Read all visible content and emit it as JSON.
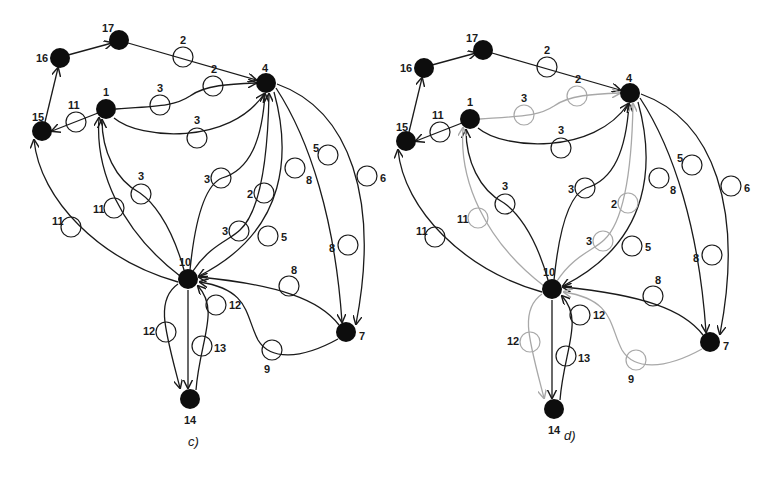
{
  "panels": [
    {
      "id": "c",
      "caption": "c)",
      "nodes": [
        {
          "id": "1",
          "label": "1"
        },
        {
          "id": "4",
          "label": "4"
        },
        {
          "id": "7",
          "label": "7"
        },
        {
          "id": "10",
          "label": "10"
        },
        {
          "id": "14",
          "label": "14"
        },
        {
          "id": "15",
          "label": "15"
        },
        {
          "id": "16",
          "label": "16"
        },
        {
          "id": "17",
          "label": "17"
        }
      ],
      "edges": [
        {
          "from": "16",
          "to": "17",
          "weight": ""
        },
        {
          "from": "15",
          "to": "16",
          "weight": ""
        },
        {
          "from": "17",
          "to": "4",
          "weight": "2"
        },
        {
          "from": "17",
          "to": "4",
          "weight": "2",
          "note": "second marker on same path"
        },
        {
          "from": "1",
          "to": "4",
          "weight": "3",
          "route": "upper"
        },
        {
          "from": "1",
          "to": "4",
          "weight": "3",
          "route": "lower"
        },
        {
          "from": "1",
          "to": "15",
          "weight": "11"
        },
        {
          "from": "10",
          "to": "15",
          "weight": "11"
        },
        {
          "from": "10",
          "to": "1",
          "weight": "11"
        },
        {
          "from": "10",
          "to": "1",
          "weight": "3"
        },
        {
          "from": "10",
          "to": "4",
          "weight": "3"
        },
        {
          "from": "10",
          "to": "4",
          "weight": "2"
        },
        {
          "from": "10",
          "to": "4",
          "weight": "3",
          "route": "inner"
        },
        {
          "from": "4",
          "to": "10",
          "weight": "8"
        },
        {
          "from": "4",
          "to": "10",
          "weight": "5"
        },
        {
          "from": "4",
          "to": "7",
          "weight": "5"
        },
        {
          "from": "4",
          "to": "7",
          "weight": "8"
        },
        {
          "from": "4",
          "to": "7",
          "weight": "6"
        },
        {
          "from": "7",
          "to": "10",
          "weight": "8"
        },
        {
          "from": "7",
          "to": "10",
          "weight": "9"
        },
        {
          "from": "10",
          "to": "14",
          "weight": "12",
          "route": "left"
        },
        {
          "from": "10",
          "to": "14",
          "weight": ""
        },
        {
          "from": "10",
          "to": "14",
          "weight": "13"
        },
        {
          "from": "14",
          "to": "10",
          "weight": "12",
          "route": "right"
        }
      ]
    },
    {
      "id": "d",
      "caption": "d)",
      "nodes": [
        {
          "id": "1",
          "label": "1"
        },
        {
          "id": "4",
          "label": "4"
        },
        {
          "id": "7",
          "label": "7"
        },
        {
          "id": "10",
          "label": "10"
        },
        {
          "id": "14",
          "label": "14"
        },
        {
          "id": "15",
          "label": "15"
        },
        {
          "id": "16",
          "label": "16"
        },
        {
          "id": "17",
          "label": "17"
        }
      ],
      "highlighted_note": "gray edges indicate removed/inactive links",
      "gray_edges": [
        {
          "from": "1",
          "to": "4",
          "weight": "3"
        },
        {
          "from": "1",
          "to": "4",
          "weight": "2"
        },
        {
          "from": "10",
          "to": "1",
          "weight": "11"
        },
        {
          "from": "10",
          "to": "4",
          "weight": "2"
        },
        {
          "from": "10",
          "to": "4",
          "weight": "3"
        },
        {
          "from": "10",
          "to": "14",
          "weight": "12"
        },
        {
          "from": "7",
          "to": "10",
          "weight": "9"
        }
      ]
    }
  ],
  "labels": {
    "c": {
      "n1": "1",
      "n4": "4",
      "n7": "7",
      "n10": "10",
      "n14": "14",
      "n15": "15",
      "n16": "16",
      "n17": "17",
      "w_17_4_a": "2",
      "w_17_4_b": "2",
      "w_1_4_up": "3",
      "w_1_4_low": "3",
      "w_1_15": "11",
      "w_10_15": "11",
      "w_10_1a": "11",
      "w_10_1b": "3",
      "w_10_4a": "3",
      "w_10_4b": "2",
      "w_10_4c": "3",
      "w_4_10a": "8",
      "w_4_10b": "5",
      "w_4_7a": "5",
      "w_4_7b": "8",
      "w_4_7c": "6",
      "w_7_10a": "8",
      "w_7_10b": "9",
      "w_10_14a": "12",
      "w_10_14b": "13",
      "w_10_14c": "12",
      "caption": "c)"
    },
    "d": {
      "n1": "1",
      "n4": "4",
      "n7": "7",
      "n10": "10",
      "n14": "14",
      "n15": "15",
      "n16": "16",
      "n17": "17",
      "w_17_4_a": "2",
      "w_17_4_b": "2",
      "w_1_4_up": "3",
      "w_1_4_low": "3",
      "w_1_15": "11",
      "w_10_15": "11",
      "w_10_1a": "11",
      "w_10_1b": "3",
      "w_10_4a": "3",
      "w_10_4b": "2",
      "w_10_4c": "3",
      "w_4_10a": "8",
      "w_4_10b": "5",
      "w_4_7a": "5",
      "w_4_7b": "8",
      "w_4_7c": "6",
      "w_7_10a": "8",
      "w_7_10b": "9",
      "w_10_14a": "12",
      "w_10_14b": "13",
      "w_10_14c": "12",
      "caption": "d)"
    }
  },
  "colors": {
    "edge": "#1a1a1a",
    "edge_inactive": "#a8a8a8",
    "node": "#0d0d0d",
    "background": "#ffffff"
  }
}
